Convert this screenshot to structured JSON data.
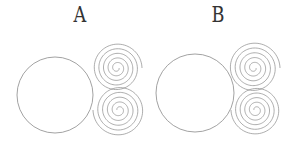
{
  "panels": [
    {
      "label": "A",
      "label_x": 72,
      "circle": {
        "cx": 55,
        "cy": 95,
        "r": 38
      },
      "spirals": [
        {
          "cx": 117,
          "cy": 68,
          "r": 25,
          "turns": 5
        },
        {
          "cx": 119,
          "cy": 110,
          "r": 26,
          "turns": 5
        }
      ]
    },
    {
      "label": "B",
      "label_x": 210,
      "circle": {
        "cx": 195,
        "cy": 93,
        "r": 39
      },
      "spirals": [
        {
          "cx": 254,
          "cy": 68,
          "r": 26,
          "turns": 5
        },
        {
          "cx": 256,
          "cy": 110,
          "r": 25,
          "turns": 5
        }
      ]
    }
  ],
  "colors": {
    "stroke": "#8a8a8a",
    "label": "#333333"
  }
}
